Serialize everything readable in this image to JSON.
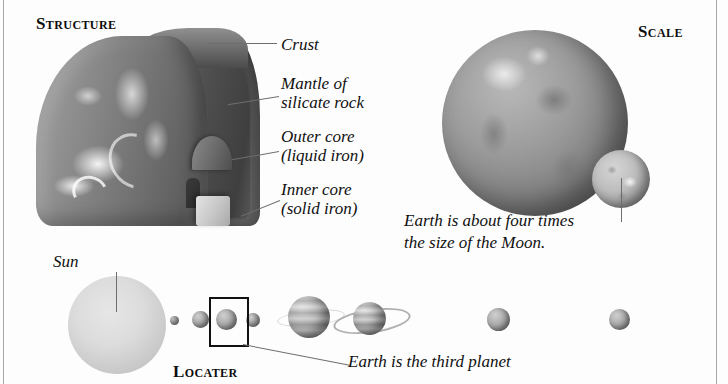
{
  "page": {
    "background_color": "#fdfdfd",
    "rule_color": "#a8a8a8"
  },
  "sections": {
    "structure": {
      "heading": "Structure",
      "labels": [
        {
          "id": "crust",
          "text": "Crust"
        },
        {
          "id": "mantle",
          "text": "Mantle of\nsilicate rock"
        },
        {
          "id": "outer_core",
          "text": "Outer core\n(liquid iron)"
        },
        {
          "id": "inner_core",
          "text": "Inner core\n(solid iron)"
        }
      ],
      "artwork_name": "earth-cutaway-illustration"
    },
    "scale": {
      "heading": "Scale",
      "caption": "Earth is about four times\nthe size of the Moon.",
      "bodies": [
        {
          "id": "earth",
          "name": "earth-sphere"
        },
        {
          "id": "moon",
          "name": "moon-sphere"
        }
      ]
    },
    "locater": {
      "heading": "Locater",
      "caption": "Earth is the third planet",
      "sun_label": "Sun",
      "bodies": [
        {
          "id": "sun",
          "name": "sun-sphere"
        },
        {
          "id": "mercury",
          "name": "planet-mercury"
        },
        {
          "id": "venus",
          "name": "planet-venus"
        },
        {
          "id": "earth",
          "name": "planet-earth"
        },
        {
          "id": "mars",
          "name": "planet-mars"
        },
        {
          "id": "jupiter",
          "name": "planet-jupiter"
        },
        {
          "id": "saturn",
          "name": "planet-saturn"
        },
        {
          "id": "uranus",
          "name": "planet-uranus"
        },
        {
          "id": "neptune",
          "name": "planet-neptune"
        }
      ],
      "highlight_box_target": "earth"
    }
  }
}
